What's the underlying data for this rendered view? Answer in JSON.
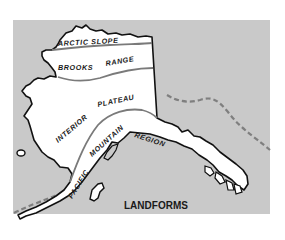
{
  "map": {
    "title": "LANDFORMS",
    "regions": [
      {
        "name": "ARCTIC SLOPE"
      },
      {
        "name": "BROOKS RANGE"
      },
      {
        "name": "INTERIOR PLATEAU"
      },
      {
        "name": "PACIFIC MOUNTAIN REGION"
      }
    ],
    "colors": {
      "background": "#c9c9c9",
      "land": "#ffffff",
      "coastline": "#111111",
      "region_boundary": "#7a7a7a",
      "dashed_line": "#7f7f7f"
    }
  },
  "labels": {
    "arctic_slope": "ARCTIC SLOPE",
    "brooks": "BROOKS",
    "range": "RANGE",
    "interior": "INTERIOR",
    "plateau": "PLATEAU",
    "pacific": "PACIFIC",
    "mountain_region": "MOUNTAIN REGION"
  }
}
